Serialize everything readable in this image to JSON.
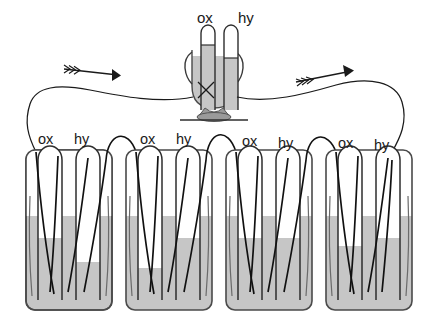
{
  "figure": {
    "background_color": "#ffffff",
    "liquid_color": "#c6c6c6",
    "liquid_color_dark": "#9e9e9e",
    "glass_stroke": "#3a3a3a",
    "wire_color": "#111111"
  },
  "top_cell": {
    "name": "measuring-voltameter",
    "labels": {
      "ox": "ox",
      "hy": "hy"
    },
    "ox_label_x": 197,
    "hy_label_x": 239,
    "label_y": 18,
    "tube_gas_color": "#ffffff",
    "tube_liquid_color": "#c6c6c6",
    "base_color": "#9a9a9a"
  },
  "circuit": {
    "left_arrow": {
      "name": "current-arrow-left",
      "direction": "right",
      "x": 105,
      "y": 72
    },
    "right_arrow": {
      "name": "current-arrow-right",
      "direction": "right",
      "x": 345,
      "y": 70
    }
  },
  "cells": [
    {
      "index": 1,
      "name": "cell-1",
      "x": 26,
      "labels": {
        "ox": "ox",
        "hy": "hy"
      },
      "ox_label_x": 46,
      "hy_label_x": 80,
      "label_y": 140,
      "liquid_level_y": 216,
      "ox_tube_liquid_y": 238,
      "hy_tube_liquid_y": 262
    },
    {
      "index": 2,
      "name": "cell-2",
      "x": 126,
      "labels": {
        "ox": "ox",
        "hy": "hy"
      },
      "ox_label_x": 148,
      "hy_label_x": 180,
      "label_y": 140,
      "liquid_level_y": 216,
      "ox_tube_liquid_y": 268,
      "hy_tube_liquid_y": 238
    },
    {
      "index": 3,
      "name": "cell-3",
      "x": 226,
      "labels": {
        "ox": "ox",
        "hy": "hy"
      },
      "ox_label_x": 249,
      "hy_label_x": 283,
      "label_y": 142,
      "liquid_level_y": 216,
      "ox_tube_liquid_y": 238,
      "hy_tube_liquid_y": 238
    },
    {
      "index": 4,
      "name": "cell-4",
      "x": 326,
      "labels": {
        "ox": "ox",
        "hy": "hy"
      },
      "ox_label_x": 345,
      "hy_label_x": 379,
      "label_y": 146,
      "liquid_level_y": 216,
      "ox_tube_liquid_y": 246,
      "hy_tube_liquid_y": 238
    }
  ]
}
